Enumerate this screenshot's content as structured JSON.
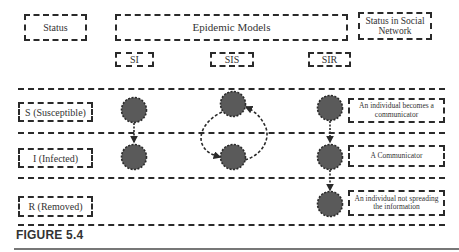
{
  "header": {
    "status_label": "Status",
    "models_label": "Epidemic Models",
    "social_label": "Status in Social Network"
  },
  "models": [
    {
      "name": "SI"
    },
    {
      "name": "SIS"
    },
    {
      "name": "SIR"
    }
  ],
  "rows": [
    {
      "label": "S (Susceptible)",
      "social_status": "An individual becomes a communicator"
    },
    {
      "label": "I (Infected)",
      "social_status": "A Communicator"
    },
    {
      "label": "R (Removed)",
      "social_status": "An individual not spreading the information"
    }
  ],
  "colors": {
    "node_fill": "#5a5a5a",
    "line": "#2a2a2a"
  },
  "caption": "FIGURE 5.4"
}
